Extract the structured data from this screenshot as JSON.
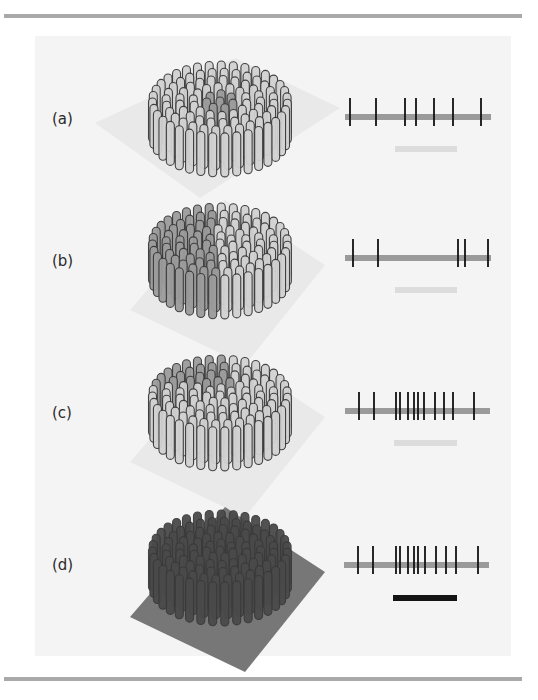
{
  "figure": {
    "panels": [
      {
        "label": "(a)",
        "bundle_shade": "light",
        "highlight": "center",
        "plane": "light",
        "spike_train": {
          "bar_y": 117,
          "bar_x0": 345,
          "bar_x1": 491,
          "spikes_x": [
            350,
            376,
            405,
            416,
            434,
            453,
            481
          ]
        },
        "summary_bar": {
          "x0": 395,
          "x1": 457,
          "y": 149,
          "color": "#dcdcdc"
        }
      },
      {
        "label": "(b)",
        "bundle_shade": "mixed-left-dark",
        "highlight": "left-half",
        "plane": "light-right",
        "spike_train": {
          "bar_y": 258,
          "bar_x0": 345,
          "bar_x1": 491,
          "spikes_x": [
            353,
            378,
            458,
            465,
            488
          ]
        },
        "summary_bar": {
          "x0": 395,
          "x1": 457,
          "y": 290,
          "color": "#dcdcdc"
        }
      },
      {
        "label": "(c)",
        "bundle_shade": "mixed-ring",
        "highlight": "outer-back",
        "plane": "light-right",
        "spike_train": {
          "bar_y": 411,
          "bar_x0": 345,
          "bar_x1": 490,
          "spikes_x": [
            359,
            374,
            396,
            400,
            408,
            414,
            418,
            424,
            435,
            444,
            453,
            474
          ]
        },
        "summary_bar": {
          "x0": 394,
          "x1": 457,
          "y": 443,
          "color": "#dcdcdc"
        }
      },
      {
        "label": "(d)",
        "bundle_shade": "dark",
        "highlight": "all",
        "plane": "dark",
        "spike_train": {
          "bar_y": 565,
          "bar_x0": 344,
          "bar_x1": 489,
          "spikes_x": [
            358,
            373,
            396,
            400,
            408,
            414,
            418,
            425,
            436,
            446,
            456,
            478
          ]
        },
        "summary_bar": {
          "x0": 393,
          "x1": 457,
          "y": 598,
          "color": "#141414"
        }
      }
    ],
    "colors": {
      "rule": "#a9a9a9",
      "panel_bg": "#f4f4f4",
      "train_bar": "#9a9a9a",
      "spike": "#111111",
      "fiber_light": "#d2d2d2",
      "fiber_mid": "#9c9c9c",
      "fiber_dark": "#4a4a4a",
      "fiber_outline": "#3a3a3a"
    }
  }
}
